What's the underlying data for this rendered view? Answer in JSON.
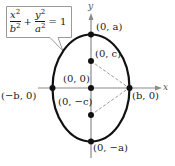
{
  "equation": {
    "term1": {
      "num": "x",
      "den": "b",
      "exp": "2"
    },
    "plus": "+",
    "term2": {
      "num": "y",
      "den": "a",
      "exp": "2"
    },
    "equals": "= 1"
  },
  "axes": {
    "x_label": "x",
    "y_label": "y"
  },
  "points": {
    "top_vertex": "(0, a)",
    "bottom_vertex": "(0, −a)",
    "focus_top": "(0, c)",
    "focus_bottom": "(0, −c)",
    "center": "(0, 0)",
    "left_covertex": "(−b, 0)",
    "right_covertex": "(b, 0)"
  },
  "colors": {
    "curve": "#111111",
    "axis": "#8a8a8a",
    "dashed": "#9a9a9a",
    "callout_border": "#9a9a9a",
    "point": "#111111"
  }
}
